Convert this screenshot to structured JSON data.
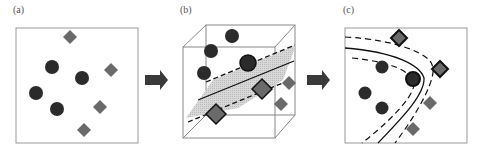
{
  "panels": [
    {
      "label": "(a)",
      "description": "Input space: circles and diamonds not linearly separable"
    },
    {
      "label": "(b)",
      "description": "Feature space: separating hyperplane with margins"
    },
    {
      "label": "(c)",
      "description": "Nonlinear decision boundary mapped back to input space"
    }
  ],
  "colors": {
    "circle": "#2b2b2b",
    "diamond": "#6a6a6a",
    "box": "#888888",
    "arrow": "#3a3a3a",
    "plane": "#c8c8c8",
    "boundary": "#111111"
  }
}
